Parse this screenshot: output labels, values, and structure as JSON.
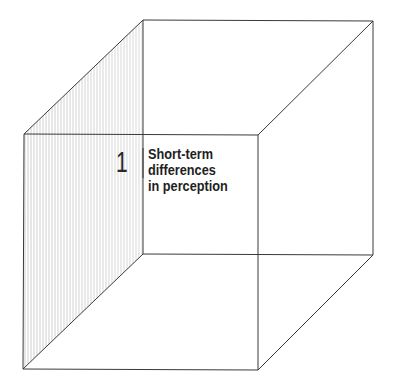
{
  "diagram": {
    "type": "wireframe-cube",
    "shaded_face": "left",
    "colors": {
      "line": "#3a3a3a",
      "hatch": "#b8b8b8",
      "background": "#ffffff"
    },
    "label": {
      "number": "1",
      "lines": [
        "Short-term",
        "differences",
        "in perception"
      ]
    }
  }
}
